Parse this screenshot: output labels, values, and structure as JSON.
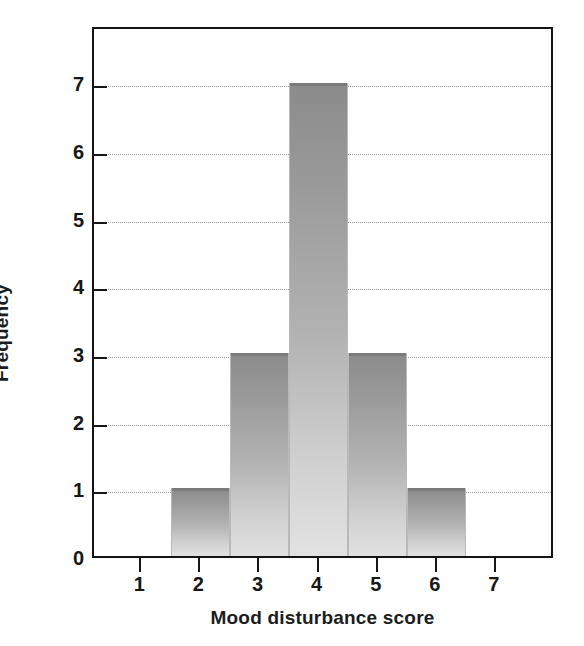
{
  "chart_data": {
    "type": "bar",
    "title": "",
    "xlabel": "Mood disturbance score",
    "ylabel": "Frequency",
    "categories": [
      "2",
      "3",
      "4",
      "5",
      "6"
    ],
    "bin_edges": [
      1.5,
      2.5,
      3.5,
      4.5,
      5.5,
      6.5
    ],
    "values": [
      1,
      3,
      7,
      3,
      1
    ],
    "x_ticks": [
      1,
      2,
      3,
      4,
      5,
      6,
      7
    ],
    "x_tick_labels": [
      "1",
      "2",
      "3",
      "4",
      "5",
      "6",
      "7"
    ],
    "y_ticks": [
      0,
      1,
      2,
      3,
      4,
      5,
      6,
      7
    ],
    "y_tick_labels": [
      "0",
      "1",
      "2",
      "3",
      "4",
      "5",
      "6",
      "7"
    ],
    "xlim": [
      0.2,
      8.0
    ],
    "ylim": [
      0,
      7.85
    ],
    "grid": "horizontal-dotted",
    "legend": "none",
    "bar_color_top": "#8b8b8b",
    "bar_color_bottom": "#e2e2e2",
    "axis_color": "#141414",
    "gridline_color": "#9a9a9a",
    "bars": [
      {
        "label": "2",
        "range": "1.5-2.5",
        "frequency": 1
      },
      {
        "label": "3",
        "range": "2.5-3.5",
        "frequency": 3
      },
      {
        "label": "4",
        "range": "3.5-4.5",
        "frequency": 7
      },
      {
        "label": "5",
        "range": "4.5-5.5",
        "frequency": 3
      },
      {
        "label": "6",
        "range": "5.5-6.5",
        "frequency": 1
      }
    ]
  }
}
